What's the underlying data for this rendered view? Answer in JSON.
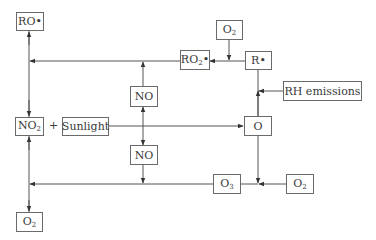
{
  "diagram": {
    "title": "",
    "nodes": {
      "ro_radical": {
        "text": "RO•"
      },
      "ro2_radical": {
        "base": "RO",
        "sub": "2",
        "suffix": "•"
      },
      "o2_top": {
        "base": "O",
        "sub": "2"
      },
      "r_radical": {
        "text": "R•"
      },
      "rh_emissions": {
        "text": "RH emissions"
      },
      "no_upper": {
        "text": "NO"
      },
      "no2": {
        "base": "NO",
        "sub": "2"
      },
      "sunlight": {
        "text": "Sunlight"
      },
      "o_atom": {
        "text": "O"
      },
      "no_lower": {
        "text": "NO"
      },
      "o3": {
        "base": "O",
        "sub": "3"
      },
      "o2_right": {
        "base": "O",
        "sub": "2"
      },
      "o2_bottom": {
        "base": "O",
        "sub": "2"
      }
    },
    "operator_plus": "+",
    "edges": [
      {
        "from": "R•",
        "to": "RO2•"
      },
      {
        "from": "O2",
        "to": "R• → RO2• junction"
      },
      {
        "from": "RO2•",
        "to": "left vertical (RO• / NO2)"
      },
      {
        "from": "NO",
        "to": "RO2• line junction"
      },
      {
        "from": "RH emissions",
        "to": "R• vertical junction"
      },
      {
        "from": "O",
        "to": "R•"
      },
      {
        "from": "NO2 + Sunlight",
        "to": "O"
      },
      {
        "from": "NO2 + Sunlight line",
        "to": "NO (upper) and NO (lower)"
      },
      {
        "from": "O",
        "to": "O3 junction"
      },
      {
        "from": "O2",
        "to": "O3 junction"
      },
      {
        "from": "O3 line",
        "to": "left vertical (NO2 / O2)"
      },
      {
        "from": "NO (lower)",
        "to": "O3 line junction"
      },
      {
        "from": "left vertical",
        "to": "RO•, NO2, O2 (bidirectional)"
      }
    ],
    "colors": {
      "line": "#555555",
      "box_border": "#6a6a6a",
      "text": "#3a3a3a"
    }
  }
}
